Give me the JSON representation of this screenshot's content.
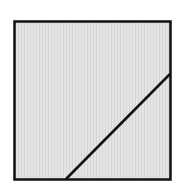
{
  "diagram": {
    "background": "#ffffff",
    "square": {
      "x": 14.5,
      "y": 21.5,
      "width": 156,
      "height": 158,
      "fill": "#e6e6e6",
      "stroke": "#111111",
      "stroke_width": 2.5
    },
    "diagonal": {
      "x1": 66,
      "y1": 179,
      "x2": 170,
      "y2": 74,
      "stroke": "#111111",
      "stroke_width": 2.5
    }
  }
}
